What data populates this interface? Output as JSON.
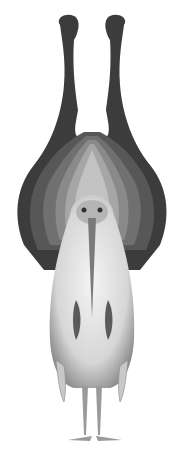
{
  "image": {
    "subject": "Engraved illustration of a bird with fan-like striped wings raised above it, seen from front",
    "colors": {
      "background": "#ffffff",
      "dark_stripe": "#3a3a3a",
      "mid_stripe": "#6e6e6e",
      "light_stripe": "#a8a8a8",
      "body": "#e6e6e6",
      "body_shadow": "#9a9a9a"
    }
  }
}
